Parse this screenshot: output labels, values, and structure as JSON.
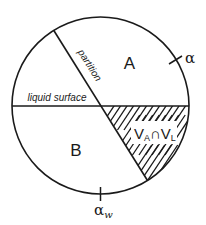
{
  "diagram": {
    "regions": {
      "a_label": "A",
      "b_label": "B"
    },
    "lines": {
      "partition_label": "partition",
      "liquid_surface_label": "liquid surface"
    },
    "intersection": {
      "v1": "V",
      "sub1": "A",
      "cap": "∩",
      "v2": "V",
      "sub2": "L"
    },
    "ticks": {
      "alpha_label": "α",
      "alpha_w_main": "α",
      "alpha_w_sub": "w"
    },
    "colors": {
      "stroke": "#1a1a1a",
      "background": "#ffffff"
    }
  }
}
